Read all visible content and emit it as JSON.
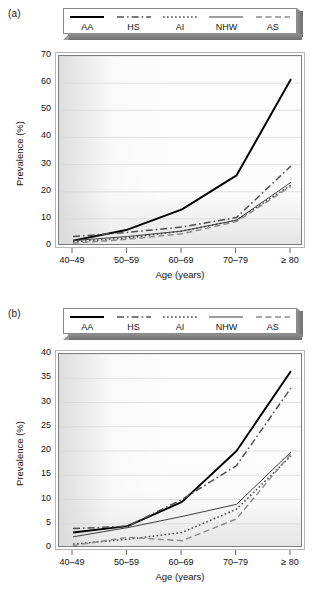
{
  "figure": {
    "panels": [
      {
        "letter": "(a)",
        "legend": [
          {
            "label": "AA",
            "style": "solid-thick",
            "color": "#000000"
          },
          {
            "label": "HS",
            "style": "dash-dot",
            "color": "#555555"
          },
          {
            "label": "AI",
            "style": "dotted",
            "color": "#555555"
          },
          {
            "label": "NHW",
            "style": "solid-thin",
            "color": "#4a4a4a"
          },
          {
            "label": "AS",
            "style": "dashed",
            "color": "#777777"
          }
        ],
        "chart_data": {
          "type": "line",
          "title": "",
          "xlabel": "Age (years)",
          "ylabel": "Prevalence (%)",
          "categories": [
            "40–49",
            "50–59",
            "60–69",
            "70–79",
            "≥ 80"
          ],
          "ylim": [
            0,
            70
          ],
          "yticks": [
            0,
            10,
            20,
            30,
            40,
            50,
            60,
            70
          ],
          "grid": true,
          "legend_position": "top",
          "series": [
            {
              "name": "AA",
              "values": [
                2.0,
                6.0,
                13.5,
                26.0,
                61.5
              ]
            },
            {
              "name": "HS",
              "values": [
                3.5,
                5.0,
                7.0,
                10.5,
                29.5
              ]
            },
            {
              "name": "AI",
              "values": [
                1.5,
                3.0,
                5.5,
                9.5,
                22.5
              ]
            },
            {
              "name": "NHW",
              "values": [
                2.0,
                3.5,
                5.5,
                9.5,
                23.5
              ]
            },
            {
              "name": "AS",
              "values": [
                1.0,
                2.5,
                4.5,
                9.0,
                22.0
              ]
            }
          ]
        }
      },
      {
        "letter": "(b)",
        "legend": [
          {
            "label": "AA",
            "style": "solid-thick",
            "color": "#000000"
          },
          {
            "label": "HS",
            "style": "dash-dot",
            "color": "#555555"
          },
          {
            "label": "AI",
            "style": "dotted",
            "color": "#555555"
          },
          {
            "label": "NHW",
            "style": "solid-thin",
            "color": "#4a4a4a"
          },
          {
            "label": "AS",
            "style": "dashed",
            "color": "#777777"
          }
        ],
        "chart_data": {
          "type": "line",
          "title": "",
          "xlabel": "Age (years)",
          "ylabel": "Prevalence (%)",
          "categories": [
            "40–49",
            "50–59",
            "60–69",
            "70–79",
            "≥ 80"
          ],
          "ylim": [
            0,
            40
          ],
          "yticks": [
            0,
            5,
            10,
            15,
            20,
            25,
            30,
            35,
            40
          ],
          "grid": true,
          "legend_position": "top",
          "series": [
            {
              "name": "AA",
              "values": [
                3.2,
                4.5,
                9.5,
                20.0,
                36.5
              ]
            },
            {
              "name": "HS",
              "values": [
                4.0,
                4.5,
                10.0,
                17.0,
                33.0
              ]
            },
            {
              "name": "AI",
              "values": [
                0.8,
                1.8,
                3.2,
                8.0,
                19.0
              ]
            },
            {
              "name": "NHW",
              "values": [
                2.3,
                4.2,
                6.5,
                9.0,
                19.8
              ]
            },
            {
              "name": "AS",
              "values": [
                0.5,
                2.2,
                1.5,
                6.0,
                19.5
              ]
            }
          ]
        }
      }
    ]
  }
}
